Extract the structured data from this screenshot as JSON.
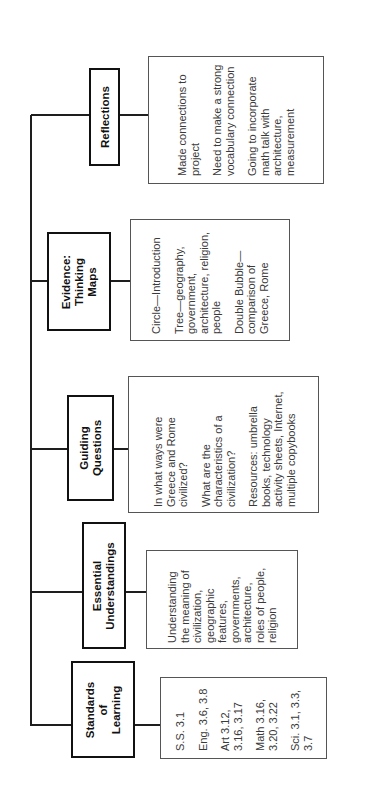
{
  "diagram": {
    "orientation": "rotated-90-ccw",
    "categories": [
      {
        "id": "standards",
        "heading": "Standards of Learning",
        "heading_lines": [
          "Standards",
          "of",
          "Learning"
        ],
        "items": [
          "S.S. 3.1",
          "Eng. 3.6, 3.8",
          "Art 3.12, 3.16, 3.17",
          "Math 3.16, 3.20, 3.22",
          "Sci. 3.1, 3.3, 3.7"
        ]
      },
      {
        "id": "essential",
        "heading": "Essential Understandings",
        "heading_lines": [
          "Essential",
          "Understandings"
        ],
        "items": [
          "Understanding the meaning of civilization, geographic features, governments, architecture, roles of people, religion"
        ]
      },
      {
        "id": "guiding",
        "heading": "Guiding Questions",
        "heading_lines": [
          "Guiding",
          "Questions"
        ],
        "items": [
          "In what ways were Greece and Rome civilized?",
          "What are the characteristics of a civilization?",
          "Resources: umbrella books, technology activity sheets, Internet, multiple copybooks"
        ]
      },
      {
        "id": "evidence",
        "heading": "Evidence: Thinking Maps",
        "heading_lines": [
          "Evidence:",
          "Thinking",
          "Maps"
        ],
        "items": [
          "Circle—Introduction",
          "Tree—geography, government, architecture, religion, people",
          "Double Bubble—comparison of Greece, Rome"
        ]
      },
      {
        "id": "reflections",
        "heading": "Reflections",
        "heading_lines": [
          "Reflections"
        ],
        "items": [
          "Made connections to project",
          "Need to make a strong vocabulary connection",
          "Going to incorporate math talk with architecture, measurement"
        ]
      }
    ]
  }
}
